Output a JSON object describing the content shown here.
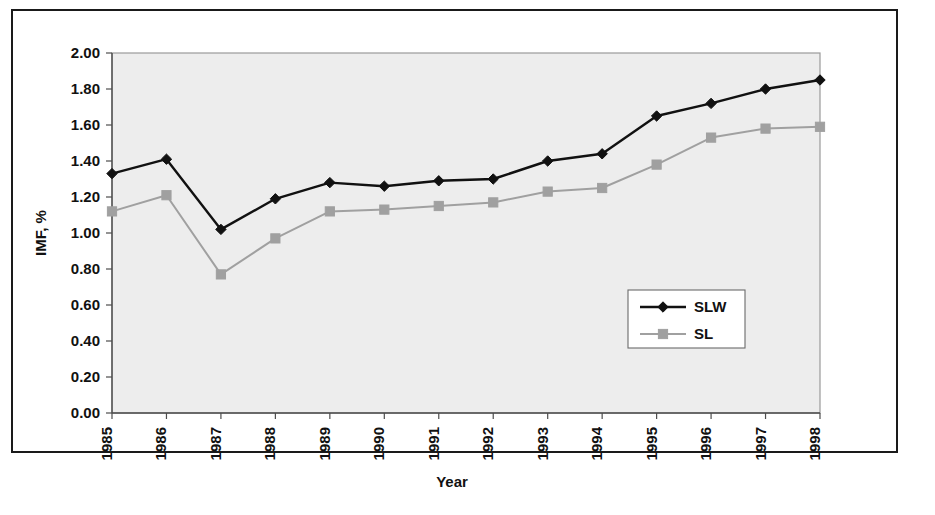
{
  "chart_data": {
    "type": "line",
    "title": "",
    "xlabel": "Year",
    "ylabel": "IMF, %",
    "categories": [
      "1985",
      "1986",
      "1987",
      "1988",
      "1989",
      "1990",
      "1991",
      "1992",
      "1993",
      "1994",
      "1995",
      "1996",
      "1997",
      "1998"
    ],
    "ylim": [
      0.0,
      2.0
    ],
    "ytick_step": 0.2,
    "ytick_labels": [
      "0.00",
      "0.20",
      "0.40",
      "0.60",
      "0.80",
      "1.00",
      "1.20",
      "1.40",
      "1.60",
      "1.80",
      "2.00"
    ],
    "ytick_values": [
      0.0,
      0.2,
      0.4,
      0.6,
      0.8,
      1.0,
      1.2,
      1.4,
      1.6,
      1.8,
      2.0
    ],
    "grid": false,
    "legend_position": "inside-right-middle",
    "series": [
      {
        "name": "SLW",
        "color": "#111111",
        "marker": "diamond",
        "values": [
          1.33,
          1.41,
          1.02,
          1.19,
          1.28,
          1.26,
          1.29,
          1.3,
          1.4,
          1.44,
          1.65,
          1.72,
          1.8,
          1.85
        ]
      },
      {
        "name": "SL",
        "color": "#a0a0a0",
        "marker": "square",
        "values": [
          1.12,
          1.21,
          0.77,
          0.97,
          1.12,
          1.13,
          1.15,
          1.17,
          1.23,
          1.25,
          1.38,
          1.53,
          1.58,
          1.59
        ]
      }
    ]
  },
  "legend": {
    "items": [
      {
        "label": "SLW"
      },
      {
        "label": "SL"
      }
    ]
  },
  "axes": {
    "y_axis_title": "IMF, %",
    "x_axis_title": "Year"
  },
  "colors": {
    "series_slw": "#111111",
    "series_sl": "#a0a0a0",
    "plot_background": "#ededed",
    "frame_border": "#1a1a1a",
    "axis": "#4d4d4d"
  }
}
